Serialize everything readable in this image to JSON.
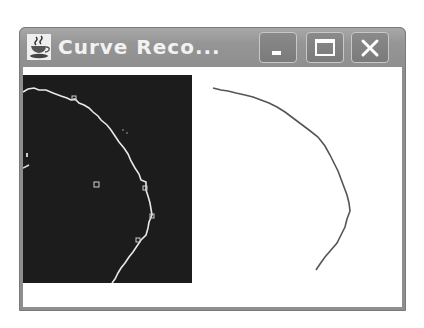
{
  "window": {
    "title": "Curve Reco...",
    "icon": "java-coffee-cup-icon",
    "buttons": {
      "minimize": "minimize-icon",
      "maximize": "maximize-icon",
      "close": "close-icon"
    }
  },
  "colors": {
    "frame": "#8e8e8e",
    "title_text": "#f2f2f2",
    "image_background": "#1c1c1c",
    "edge_curve": "#e8e8e8",
    "reconstructed_curve": "#555555",
    "client_background": "#ffffff"
  },
  "panels": {
    "left": {
      "description": "binary edge image (white edges on black)",
      "edge_points": [
        [
          0,
          25
        ],
        [
          11,
          21
        ],
        [
          23,
          23
        ],
        [
          48,
          33
        ],
        [
          61,
          40
        ],
        [
          78,
          55
        ],
        [
          98,
          75
        ],
        [
          116,
          105
        ],
        [
          128,
          123
        ],
        [
          131,
          140
        ],
        [
          128,
          165
        ],
        [
          118,
          180
        ],
        [
          106,
          195
        ],
        [
          93,
          208
        ]
      ],
      "small_marks": [
        [
          73,
          110
        ],
        [
          3,
          103
        ]
      ]
    },
    "right": {
      "description": "reconstructed curve",
      "curve_points": [
        [
          190,
          21
        ],
        [
          218,
          26
        ],
        [
          243,
          35
        ],
        [
          268,
          53
        ],
        [
          303,
          80
        ],
        [
          318,
          115
        ],
        [
          330,
          145
        ],
        [
          326,
          170
        ],
        [
          316,
          190
        ],
        [
          293,
          203
        ]
      ]
    }
  }
}
